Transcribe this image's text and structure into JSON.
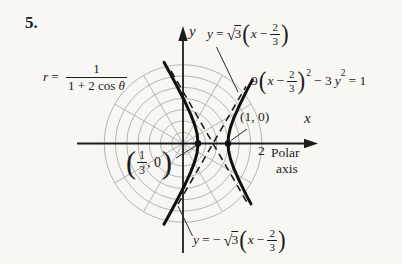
{
  "problem_number": "5.",
  "colors": {
    "ink": "#1c1c1c",
    "grid": "#b5b5b5",
    "paper": "#f8f7f4"
  },
  "equations": {
    "polar": {
      "lhs": "r",
      "rel": "=",
      "numerator": "1",
      "den_prefix": "1 + 2 cos ",
      "den_theta": "θ"
    },
    "asym_top": {
      "lhs": "y",
      "rel": "=",
      "radical": "√",
      "radicand": "3",
      "paren_open": "(",
      "arg_var": "x",
      "arg_minus": "−",
      "frac_num": "2",
      "frac_den": "3",
      "paren_close": ")"
    },
    "cartesian": {
      "coeff": "9",
      "paren_open": "(",
      "arg_var": "x",
      "arg_minus": "−",
      "frac_num": "2",
      "frac_den": "3",
      "paren_close": ")",
      "exp1": "2",
      "minus_3": "− 3",
      "var2": "y",
      "exp2": "2",
      "equals_rhs": "= 1"
    },
    "asym_bottom": {
      "lhs": "y",
      "rel": "= −",
      "radical": "√",
      "radicand": "3",
      "paren_open": "(",
      "arg_var": "x",
      "arg_minus": "−",
      "frac_num": "2",
      "frac_den": "3",
      "paren_close": ")"
    }
  },
  "points": {
    "vertex_right_label": "(1, 0)",
    "vertex_left": {
      "paren_open": "(",
      "frac_num": "1",
      "frac_den": "3",
      "rest": ", 0",
      "paren_close": ")"
    }
  },
  "axis_labels": {
    "x": "x",
    "y": "y",
    "tick_2": "2",
    "polar_line1": "Polar",
    "polar_line2": "axis"
  },
  "figure": {
    "type": "polar-grid plot of a hyperbola with dashed asymptotes",
    "labeled_vertices": [
      "(1/3, 0)",
      "(1, 0)"
    ],
    "grid_rings": 7,
    "spoke_step_degrees": 30,
    "asymptotes_dashed": true
  }
}
